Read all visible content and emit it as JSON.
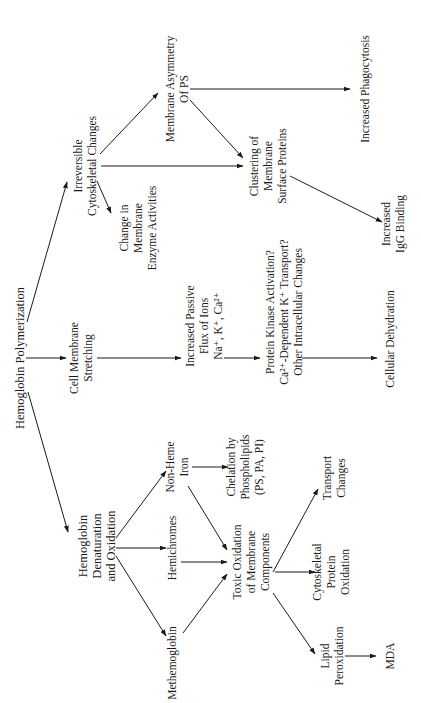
{
  "diagram": {
    "orientation": "rotated-90-ccw",
    "nodes": {
      "hb_poly": {
        "label": "Hemoglobin Polymerization"
      },
      "irrev_cyto": {
        "lines": [
          "Irreversible",
          "Cytoskeletal Changes"
        ]
      },
      "change_membrane": {
        "lines": [
          "Change in",
          "Membrane",
          "Enzyme Activities"
        ]
      },
      "membrane_asym": {
        "lines": [
          "Membrane Asymmetry",
          "Of PS"
        ]
      },
      "clustering": {
        "lines": [
          "Clustering of",
          "Membrane",
          "Surface Proteins"
        ]
      },
      "phagocytosis": {
        "label": "Increased Phagocytosis"
      },
      "igg": {
        "lines": [
          "Increased",
          "IgG Binding"
        ]
      },
      "cell_stretch": {
        "lines": [
          "Cell Membrane",
          "Stretching"
        ]
      },
      "ion_flux": {
        "lines": [
          "Increased Passive",
          "Flux of Ions",
          "Na⁺, K⁺, Ca²⁺"
        ]
      },
      "kinase": {
        "lines": [
          "Protein Kinase Activation?",
          "Ca²⁺-Dependent K⁺ Transport?",
          "Other Intracellular Changes"
        ]
      },
      "dehydration": {
        "label": "Cellular Dehydration"
      },
      "hb_denat": {
        "lines": [
          "Hemoglobin",
          "Denaturation",
          "and Oxidation"
        ]
      },
      "nonheme": {
        "lines": [
          "Non-Heme",
          "Iron"
        ]
      },
      "hemichromes": {
        "label": "Hemichromes"
      },
      "methb": {
        "label": "Methemoglobin"
      },
      "chelation": {
        "lines": [
          "Chelation by",
          "Phospholipids",
          "(PS, PA, PI)"
        ]
      },
      "toxic_ox": {
        "lines": [
          "Toxic Oxidation",
          "of Membrane",
          "Components"
        ]
      },
      "transport": {
        "lines": [
          "Transport",
          "Changes"
        ]
      },
      "cyto_prot_ox": {
        "lines": [
          "Cytoskeletal",
          "Protein",
          "Oxidation"
        ]
      },
      "lipid_perox": {
        "lines": [
          "Lipid",
          "Peroxidation"
        ]
      },
      "mda": {
        "label": "MDA"
      }
    },
    "edges": [
      {
        "from": "hb_poly",
        "to": "irrev_cyto"
      },
      {
        "from": "hb_poly",
        "to": "cell_stretch"
      },
      {
        "from": "hb_poly",
        "to": "hb_denat"
      },
      {
        "from": "irrev_cyto",
        "to": "membrane_asym"
      },
      {
        "from": "irrev_cyto",
        "to": "clustering"
      },
      {
        "from": "irrev_cyto",
        "to": "change_membrane"
      },
      {
        "from": "membrane_asym",
        "to": "phagocytosis"
      },
      {
        "from": "membrane_asym",
        "to": "clustering"
      },
      {
        "from": "clustering",
        "to": "igg"
      },
      {
        "from": "cell_stretch",
        "to": "ion_flux"
      },
      {
        "from": "ion_flux",
        "to": "kinase"
      },
      {
        "from": "kinase",
        "to": "dehydration"
      },
      {
        "from": "hb_denat",
        "to": "nonheme"
      },
      {
        "from": "hb_denat",
        "to": "hemichromes"
      },
      {
        "from": "hb_denat",
        "to": "methb"
      },
      {
        "from": "nonheme",
        "to": "chelation"
      },
      {
        "from": "nonheme",
        "to": "toxic_ox"
      },
      {
        "from": "hemichromes",
        "to": "toxic_ox"
      },
      {
        "from": "methb",
        "to": "toxic_ox"
      },
      {
        "from": "toxic_ox",
        "to": "transport"
      },
      {
        "from": "toxic_ox",
        "to": "cyto_prot_ox"
      },
      {
        "from": "toxic_ox",
        "to": "lipid_perox"
      },
      {
        "from": "lipid_perox",
        "to": "mda"
      }
    ]
  }
}
